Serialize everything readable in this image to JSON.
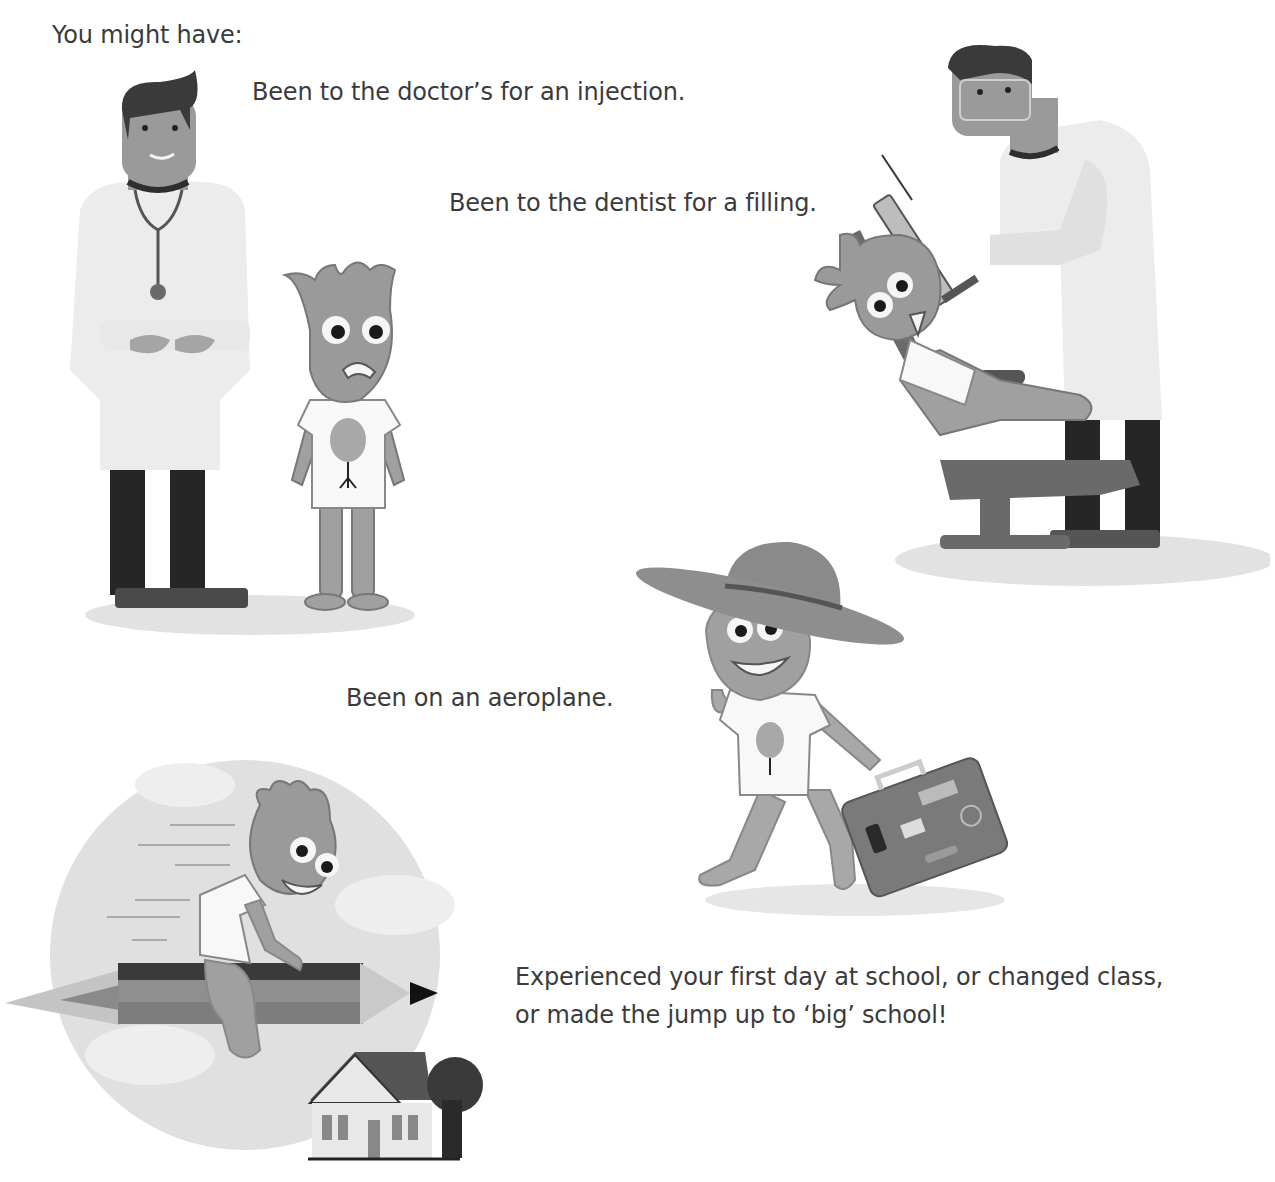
{
  "page": {
    "intro": "You might have:",
    "items": [
      {
        "id": "doctor",
        "caption": "Been to the doctor’s for an injection.",
        "illustration": "doctor-with-worried-character"
      },
      {
        "id": "dentist",
        "caption": "Been to the dentist for a filling.",
        "illustration": "dentist-with-character-in-chair"
      },
      {
        "id": "aeroplane",
        "caption": "Been on an aeroplane.",
        "illustration": "character-with-hat-and-suitcase"
      },
      {
        "id": "school",
        "caption_line1": "Experienced your first day at school, or changed class,",
        "caption_line2": "or made the jump up to ‘big’ school!",
        "illustration": "character-riding-pencil-over-school"
      }
    ]
  },
  "colors": {
    "text": "#3b3b3b",
    "character": "#9a9a9a",
    "coat": "#ececec",
    "dark": "#2a2a2a",
    "shadow": "#e2e2e2"
  }
}
